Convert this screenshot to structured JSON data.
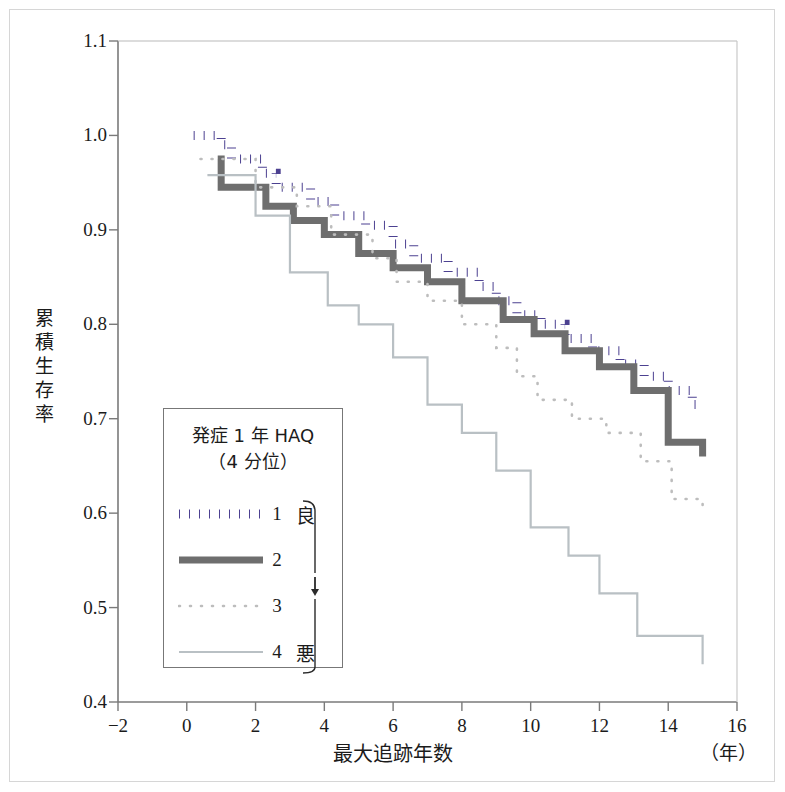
{
  "chart_data": {
    "type": "line",
    "subtype": "kaplan-meier-step",
    "title": "",
    "xlabel": "最大追跡年数",
    "xunit": "（年）",
    "ylabel": "累積生存率",
    "xlim": [
      -2,
      16
    ],
    "ylim": [
      0.4,
      1.1
    ],
    "xticks": [
      "−2",
      "0",
      "2",
      "4",
      "6",
      "8",
      "10",
      "12",
      "14",
      "16"
    ],
    "xtick_values": [
      -2,
      0,
      2,
      4,
      6,
      8,
      10,
      12,
      14,
      16
    ],
    "yticks": [
      "0.4",
      "0.5",
      "0.6",
      "0.7",
      "0.8",
      "0.9",
      "1.0",
      "1.1"
    ],
    "ytick_values": [
      0.4,
      0.5,
      0.6,
      0.7,
      0.8,
      0.9,
      1.0,
      1.1
    ],
    "grid": false,
    "legend_position": "lower-left-inside",
    "series": [
      {
        "name": "1",
        "label": "1　良",
        "color": "#4c4191",
        "style": "dotted-thick",
        "points": [
          [
            0.2,
            1.0
          ],
          [
            1.0,
            1.0
          ],
          [
            1.0,
            0.99
          ],
          [
            1.3,
            0.99
          ],
          [
            1.3,
            0.975
          ],
          [
            2.2,
            0.975
          ],
          [
            2.2,
            0.96
          ],
          [
            2.6,
            0.96
          ],
          [
            2.6,
            0.945
          ],
          [
            3.6,
            0.945
          ],
          [
            3.6,
            0.93
          ],
          [
            4.3,
            0.93
          ],
          [
            4.3,
            0.915
          ],
          [
            5.2,
            0.915
          ],
          [
            5.2,
            0.905
          ],
          [
            6.0,
            0.905
          ],
          [
            6.0,
            0.885
          ],
          [
            6.6,
            0.885
          ],
          [
            6.6,
            0.87
          ],
          [
            7.6,
            0.87
          ],
          [
            7.6,
            0.855
          ],
          [
            8.5,
            0.855
          ],
          [
            8.5,
            0.84
          ],
          [
            9.0,
            0.84
          ],
          [
            9.0,
            0.825
          ],
          [
            9.6,
            0.825
          ],
          [
            9.6,
            0.81
          ],
          [
            10.3,
            0.81
          ],
          [
            10.3,
            0.8
          ],
          [
            11.0,
            0.8
          ],
          [
            11.0,
            0.785
          ],
          [
            11.8,
            0.785
          ],
          [
            11.8,
            0.772
          ],
          [
            12.6,
            0.772
          ],
          [
            12.6,
            0.758
          ],
          [
            13.3,
            0.758
          ],
          [
            13.3,
            0.745
          ],
          [
            14.0,
            0.745
          ],
          [
            14.0,
            0.73
          ],
          [
            14.7,
            0.73
          ],
          [
            14.7,
            0.715
          ],
          [
            15.0,
            0.715
          ]
        ]
      },
      {
        "name": "2",
        "label": "2",
        "color": "#6e6e6e",
        "style": "solid-thick",
        "points": [
          [
            0.9,
            0.975
          ],
          [
            1.0,
            0.975
          ],
          [
            1.0,
            0.945
          ],
          [
            2.3,
            0.945
          ],
          [
            2.3,
            0.925
          ],
          [
            3.1,
            0.925
          ],
          [
            3.1,
            0.91
          ],
          [
            4.0,
            0.91
          ],
          [
            4.0,
            0.895
          ],
          [
            5.0,
            0.895
          ],
          [
            5.0,
            0.875
          ],
          [
            6.0,
            0.875
          ],
          [
            6.0,
            0.86
          ],
          [
            7.0,
            0.86
          ],
          [
            7.0,
            0.845
          ],
          [
            8.0,
            0.845
          ],
          [
            8.0,
            0.825
          ],
          [
            9.2,
            0.825
          ],
          [
            9.2,
            0.805
          ],
          [
            10.1,
            0.805
          ],
          [
            10.1,
            0.79
          ],
          [
            11.0,
            0.79
          ],
          [
            11.0,
            0.772
          ],
          [
            12.0,
            0.772
          ],
          [
            12.0,
            0.755
          ],
          [
            13.0,
            0.755
          ],
          [
            13.0,
            0.73
          ],
          [
            14.0,
            0.73
          ],
          [
            14.0,
            0.675
          ],
          [
            15.0,
            0.675
          ],
          [
            15.0,
            0.66
          ]
        ]
      },
      {
        "name": "3",
        "label": "3",
        "color": "#bdbdbd",
        "style": "dotted-thin",
        "points": [
          [
            0.4,
            0.975
          ],
          [
            2.0,
            0.975
          ],
          [
            2.0,
            0.945
          ],
          [
            3.2,
            0.945
          ],
          [
            3.2,
            0.925
          ],
          [
            4.2,
            0.925
          ],
          [
            4.2,
            0.895
          ],
          [
            5.4,
            0.895
          ],
          [
            5.4,
            0.87
          ],
          [
            6.1,
            0.87
          ],
          [
            6.1,
            0.845
          ],
          [
            7.0,
            0.845
          ],
          [
            7.0,
            0.825
          ],
          [
            8.0,
            0.825
          ],
          [
            8.0,
            0.8
          ],
          [
            9.0,
            0.8
          ],
          [
            9.0,
            0.775
          ],
          [
            9.6,
            0.775
          ],
          [
            9.6,
            0.745
          ],
          [
            10.2,
            0.745
          ],
          [
            10.2,
            0.72
          ],
          [
            11.2,
            0.72
          ],
          [
            11.2,
            0.7
          ],
          [
            12.2,
            0.7
          ],
          [
            12.2,
            0.685
          ],
          [
            13.2,
            0.685
          ],
          [
            13.2,
            0.655
          ],
          [
            14.1,
            0.655
          ],
          [
            14.1,
            0.615
          ],
          [
            15.0,
            0.615
          ],
          [
            15.0,
            0.6
          ]
        ]
      },
      {
        "name": "4",
        "label": "4　悪",
        "color": "#b9c0c4",
        "style": "solid-thin",
        "points": [
          [
            0.6,
            0.958
          ],
          [
            2.0,
            0.958
          ],
          [
            2.0,
            0.915
          ],
          [
            3.0,
            0.915
          ],
          [
            3.0,
            0.855
          ],
          [
            4.1,
            0.855
          ],
          [
            4.1,
            0.82
          ],
          [
            5.0,
            0.82
          ],
          [
            5.0,
            0.8
          ],
          [
            6.0,
            0.8
          ],
          [
            6.0,
            0.765
          ],
          [
            7.0,
            0.765
          ],
          [
            7.0,
            0.715
          ],
          [
            8.0,
            0.715
          ],
          [
            8.0,
            0.685
          ],
          [
            9.0,
            0.685
          ],
          [
            9.0,
            0.645
          ],
          [
            10.0,
            0.645
          ],
          [
            10.0,
            0.585
          ],
          [
            11.1,
            0.585
          ],
          [
            11.1,
            0.555
          ],
          [
            12.0,
            0.555
          ],
          [
            12.0,
            0.515
          ],
          [
            13.1,
            0.515
          ],
          [
            13.1,
            0.47
          ],
          [
            15.0,
            0.47
          ],
          [
            15.0,
            0.44
          ]
        ]
      }
    ]
  },
  "axes": {
    "y_title_chars": [
      "累",
      "積",
      "生",
      "存",
      "率"
    ],
    "x_title": "最大追跡年数",
    "x_unit": "（年）"
  },
  "legend": {
    "title_line1": "発症 1 年 HAQ",
    "title_line2": "（4 分位）",
    "rows": [
      {
        "num": "1",
        "end": "良",
        "style": "dotted-thick",
        "color": "#4c4191"
      },
      {
        "num": "2",
        "end": "",
        "style": "solid-thick",
        "color": "#6e6e6e"
      },
      {
        "num": "3",
        "end": "",
        "style": "dotted-thin",
        "color": "#bdbdbd"
      },
      {
        "num": "4",
        "end": "悪",
        "style": "solid-thin",
        "color": "#b9c0c4"
      }
    ],
    "arrow_glyph": "↓"
  },
  "colors": {
    "axis": "#7a7a7a",
    "text": "#1b1b1b",
    "frame": "#d6d6d6",
    "legend_border": "#777777"
  }
}
